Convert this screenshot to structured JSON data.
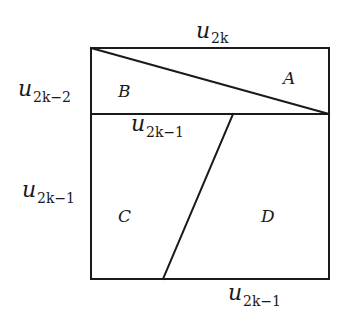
{
  "diagram": {
    "labels": {
      "top": {
        "base": "u",
        "subscript": "2k"
      },
      "left_upper": {
        "base": "u",
        "subscript": "2k−2"
      },
      "middle": {
        "base": "u",
        "subscript": "2k−1"
      },
      "left_lower": {
        "base": "u",
        "subscript": "2k−1"
      },
      "bottom": {
        "base": "u",
        "subscript": "2k−1"
      }
    },
    "regions": {
      "a": "A",
      "b": "B",
      "c": "C",
      "d": "D"
    },
    "colors": {
      "line": "#1a1a1a",
      "background": "#ffffff"
    }
  }
}
